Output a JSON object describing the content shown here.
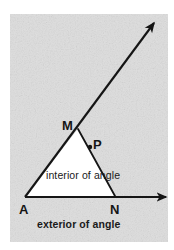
{
  "figure": {
    "kind": "geometry-diagram",
    "canvas": {
      "width": 174,
      "height": 250
    },
    "colors": {
      "page_background": "#ffffff",
      "shaded_exterior": "#d8d8d8",
      "unshaded_interior": "#ffffff",
      "ink": "#151515"
    },
    "shaded_region": {
      "label": "exterior of angle",
      "x": 10,
      "y": 14,
      "width": 158,
      "height": 228
    },
    "labels": {
      "vertex_A": "A",
      "vertex_M": "M",
      "vertex_N": "N",
      "point_P": "P",
      "interior": "interior of angle",
      "exterior": "exterior of angle"
    },
    "points": {
      "A": {
        "x": 25,
        "y": 197
      },
      "M": {
        "x": 78,
        "y": 129
      },
      "N": {
        "x": 115,
        "y": 196
      },
      "P": {
        "x": 90,
        "y": 147
      }
    },
    "rays": [
      {
        "name": "ray-AM",
        "from": "A",
        "through": "M",
        "tip_x": 157,
        "tip_y": 20,
        "arrow": true
      },
      {
        "name": "ray-AN",
        "from": "A",
        "through": "N",
        "tip_x": 169,
        "tip_y": 197,
        "arrow": true
      }
    ],
    "segments": [
      {
        "name": "segment-MN",
        "from": "M",
        "to": "N"
      }
    ],
    "markers": [
      {
        "name": "point-marker-P",
        "x": 90,
        "y": 147,
        "r": 2.1
      }
    ]
  }
}
